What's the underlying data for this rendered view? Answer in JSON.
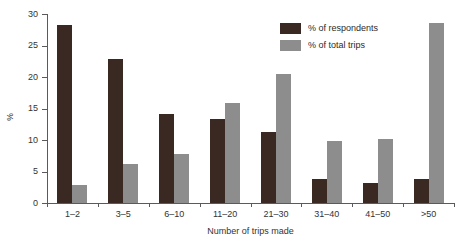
{
  "chart_data": {
    "type": "bar",
    "title": "",
    "xlabel": "Number of trips made",
    "ylabel": "%",
    "categories": [
      "1–2",
      "3–5",
      "6–10",
      "11–20",
      "21–30",
      "31–40",
      "41–50",
      ">50"
    ],
    "series": [
      {
        "name": "% of respondents",
        "color": "#3a2822",
        "values": [
          28.3,
          22.8,
          14.2,
          13.4,
          11.3,
          3.8,
          3.1,
          3.8
        ]
      },
      {
        "name": "% of total trips",
        "color": "#8d8d8d",
        "values": [
          2.8,
          6.2,
          7.8,
          15.9,
          20.5,
          9.9,
          10.2,
          28.6
        ]
      }
    ],
    "ylim": [
      0,
      30
    ],
    "yticks": [
      0,
      5,
      10,
      15,
      20,
      25,
      30
    ],
    "ytick_labels": [
      "0",
      "5",
      "10",
      "15",
      "20",
      "25",
      "30"
    ],
    "grid": false,
    "legend_position": "top-right"
  },
  "legend": {
    "entries": [
      {
        "label": "% of respondents",
        "swatch": "dark"
      },
      {
        "label": "% of total trips",
        "swatch": "light"
      }
    ]
  }
}
